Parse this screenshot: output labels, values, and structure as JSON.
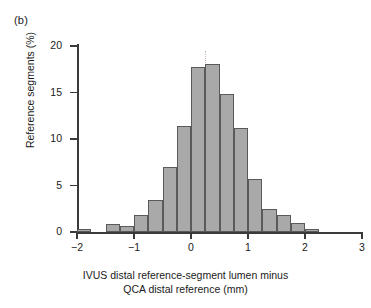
{
  "figure": {
    "panel_label": "(b)"
  },
  "chart_data": {
    "type": "bar",
    "title": "",
    "subtitle": "",
    "xlabel_line1": "IVUS distal reference-segment lumen minus",
    "xlabel_line2": "QCA distal reference (mm)",
    "ylabel": "Reference segments (%)",
    "xlim": [
      -2,
      3
    ],
    "ylim": [
      0,
      20
    ],
    "xticks": [
      -2,
      -1,
      0,
      1,
      2,
      3
    ],
    "xtick_labels": [
      "−2",
      "−1",
      "0",
      "1",
      "2",
      "3"
    ],
    "yticks": [
      0,
      5,
      10,
      15,
      20
    ],
    "ytick_labels": [
      "0",
      "5",
      "10",
      "15",
      "20"
    ],
    "grid": false,
    "legend": false,
    "bin_width": 0.25,
    "bar_fill": "#a9a9a9",
    "bar_edge": "#5a5a5a",
    "axis_color": "#3a3a3a",
    "bin_starts": [
      -2.0,
      -1.75,
      -1.5,
      -1.25,
      -1.0,
      -0.75,
      -0.5,
      -0.25,
      0.0,
      0.25,
      0.5,
      0.75,
      1.0,
      1.25,
      1.5,
      1.75,
      2.0,
      2.25,
      2.5,
      2.75
    ],
    "categories": [
      "-2.00 to -1.75",
      "-1.75 to -1.50",
      "-1.50 to -1.25",
      "-1.25 to -1.00",
      "-1.00 to -0.75",
      "-0.75 to -0.50",
      "-0.50 to -0.25",
      "-0.25 to 0.00",
      "0.00 to 0.25",
      "0.25 to 0.50",
      "0.50 to 0.75",
      "0.75 to 1.00",
      "1.00 to 1.25",
      "1.25 to 1.50",
      "1.50 to 1.75",
      "1.75 to 2.00",
      "2.00 to 2.25",
      "2.25 to 2.50",
      "2.50 to 2.75",
      "2.75 to 3.00"
    ],
    "values": [
      0.3,
      0.0,
      0.9,
      0.6,
      1.8,
      3.4,
      7.0,
      11.4,
      17.7,
      18.1,
      14.8,
      11.2,
      5.7,
      2.5,
      1.8,
      1.0,
      0.3,
      0.0,
      0.0,
      0.0
    ]
  }
}
